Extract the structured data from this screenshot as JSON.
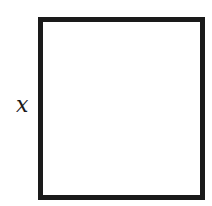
{
  "diagram": {
    "shape": "rectangle",
    "side_label": "x",
    "side_label_position": "left",
    "stroke_color": "#1a1a1a",
    "fill_color": "#ffffff"
  }
}
